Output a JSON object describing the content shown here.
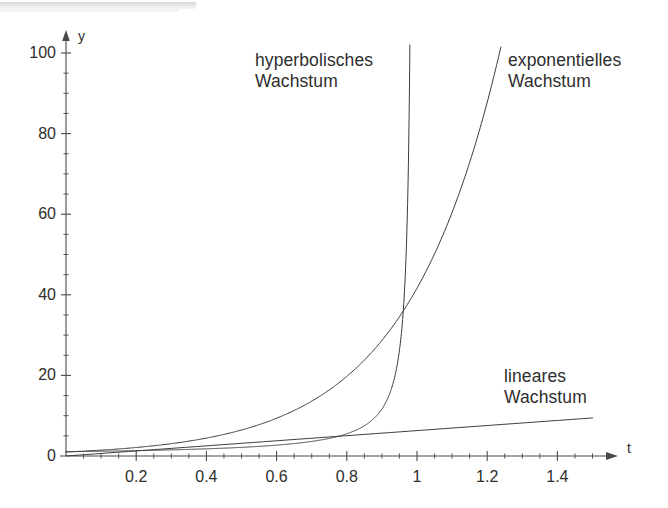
{
  "figure": {
    "name": "growth-types-comparison",
    "background_color": "#ffffff",
    "ink_color": "#3a3a3a"
  },
  "axes": {
    "y_axis_name": "y",
    "t_axis_name": "t",
    "x_tick_labels": [
      "0.2",
      "0.4",
      "0.6",
      "0.8",
      "1",
      "1.2",
      "1.4"
    ],
    "y_tick_labels": [
      "0",
      "20",
      "40",
      "60",
      "80",
      "100"
    ]
  },
  "annotations": {
    "hyperbolic": "hyperbolisches\nWachstum",
    "exponential": "exponentielles\nWachstum",
    "linear": "lineares\nWachstum"
  },
  "chart_data": {
    "type": "line",
    "title": "",
    "subtitle": "",
    "xlabel": "t",
    "ylabel": "y",
    "xlim": [
      0,
      1.51
    ],
    "ylim": [
      0,
      102
    ],
    "grid": false,
    "legend_position": "inline-annotations",
    "x_ticks_major": [
      0.2,
      0.4,
      0.6,
      0.8,
      1.0,
      1.2,
      1.4
    ],
    "x_ticks_minor_step": 0.05,
    "y_ticks_major": [
      0,
      20,
      40,
      60,
      80,
      100
    ],
    "y_ticks_minor_step": 5,
    "annotations": [
      {
        "text": "hyperbolisches Wachstum",
        "x": 0.54,
        "y": 96,
        "series": "hyperbolisches Wachstum"
      },
      {
        "text": "exponentielles Wachstum",
        "x": 1.26,
        "y": 96,
        "series": "exponentielles Wachstum"
      },
      {
        "text": "lineares Wachstum",
        "x": 1.25,
        "y": 22,
        "series": "lineares Wachstum"
      }
    ],
    "series": [
      {
        "name": "lineares Wachstum",
        "formula": "y = 6.3 t",
        "color": "#3a3a3a",
        "x": [
          0,
          0.1,
          0.2,
          0.3,
          0.4,
          0.5,
          0.6,
          0.7,
          0.8,
          0.9,
          1.0,
          1.1,
          1.2,
          1.3,
          1.4,
          1.5
        ],
        "values": [
          0,
          0.63,
          1.26,
          1.89,
          2.52,
          3.15,
          3.78,
          4.41,
          5.04,
          5.67,
          6.3,
          6.93,
          7.56,
          8.19,
          8.82,
          9.45
        ]
      },
      {
        "name": "exponentielles Wachstum",
        "formula": "y = e^(3.73 t)",
        "color": "#3a3a3a",
        "x": [
          0,
          0.1,
          0.2,
          0.3,
          0.4,
          0.5,
          0.6,
          0.7,
          0.8,
          0.9,
          1.0,
          1.05,
          1.1,
          1.15,
          1.2,
          1.235
        ],
        "values": [
          1.0,
          1.45,
          2.11,
          3.06,
          4.45,
          6.46,
          9.38,
          13.63,
          19.8,
          28.76,
          41.68,
          50.3,
          60.3,
          72.7,
          87.3,
          100.0
        ]
      },
      {
        "name": "hyperbolisches Wachstum",
        "formula": "y = 1.05 / (0.99 - t)",
        "color": "#3a3a3a",
        "asymptote_t": 0.99,
        "x": [
          0,
          0.1,
          0.2,
          0.3,
          0.4,
          0.5,
          0.6,
          0.7,
          0.8,
          0.85,
          0.9,
          0.93,
          0.955,
          0.968,
          0.978,
          0.9795
        ],
        "values": [
          1.06,
          1.18,
          1.33,
          1.52,
          1.78,
          2.14,
          2.69,
          3.62,
          5.53,
          7.5,
          11.67,
          17.5,
          30.0,
          47.7,
          87.5,
          102.0
        ]
      }
    ]
  }
}
